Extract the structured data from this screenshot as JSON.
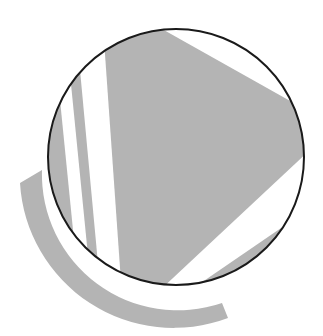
{
  "figure": {
    "kind": "geometric-figure",
    "colors": {
      "background": "#ffffff",
      "fill": "#b4b4b4",
      "outline": "#1a1a1a"
    },
    "circle": {
      "cx": 176,
      "cy": 157,
      "r": 128
    },
    "shapes": [
      {
        "name": "triangle-shape",
        "points": "104,48 146,22 304,112 304,150 160,290 122,292"
      },
      {
        "name": "stripe-left",
        "points": "52,120 68,92 84,285 70,268"
      },
      {
        "name": "stripe-middle",
        "points": "72,92 80,78 100,290 92,285"
      },
      {
        "name": "lower-wedge",
        "points": "180,295 280,228 300,222 290,262 210,300"
      },
      {
        "name": "outer-arc-band",
        "path": "M20,183 L42,170 A132,132 0 0 0 222,300 L228,318 A152,152 0 0 1 20,183 Z"
      }
    ]
  }
}
